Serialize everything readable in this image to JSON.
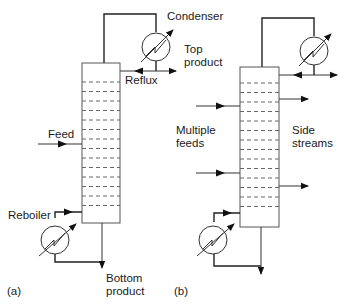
{
  "diagram": {
    "panel_a": {
      "caption": "(a)",
      "labels": {
        "condenser": "Condenser",
        "top_product_line1": "Top",
        "top_product_line2": "product",
        "reflux": "Reflux",
        "feed": "Feed",
        "reboiler": "Reboiler",
        "bottom_product_line1": "Bottom",
        "bottom_product_line2": "product"
      },
      "tray_count": 14
    },
    "panel_b": {
      "caption": "(b)",
      "labels": {
        "multiple_feeds_line1": "Multiple",
        "multiple_feeds_line2": "feeds",
        "side_streams_line1": "Side",
        "side_streams_line2": "streams"
      },
      "tray_count": 14
    },
    "colors": {
      "line": "#222222",
      "background": "#ffffff"
    }
  }
}
